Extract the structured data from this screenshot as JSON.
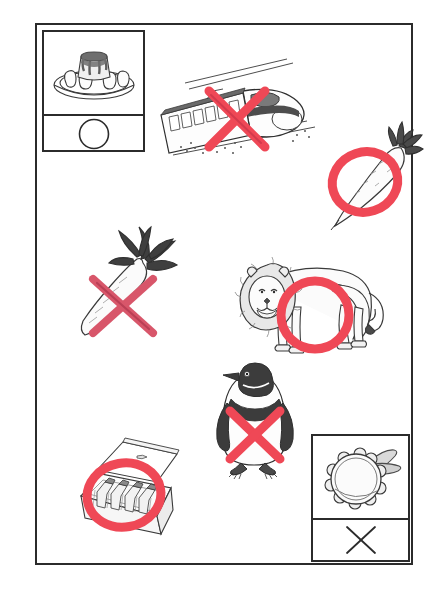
{
  "sheet": {
    "title": "Picture marking worksheet",
    "description": "Line drawings of objects and animals, each annotated with a hand-drawn red circle or red cross mark",
    "background_color": "#ffffff",
    "frame_color": "#2b2b2b",
    "mark_color": "#ef4856",
    "mark_color_dark": "#c9354a",
    "ink_color": "#3a3a3a"
  },
  "legend": {
    "top_left": {
      "picture_name": "pudding-on-plate",
      "picture_label": "Pudding on a plate",
      "mark_name": "circle-mark",
      "mark_symbol": "○",
      "mark_label": "Circle"
    },
    "bottom_right": {
      "picture_name": "tambourine",
      "picture_label": "Tambourine",
      "mark_name": "cross-mark",
      "mark_symbol": "×",
      "mark_label": "Cross"
    }
  },
  "items": [
    {
      "id": "train",
      "label": "Bullet train",
      "mark": "cross",
      "mark_label": "Cross"
    },
    {
      "id": "daikon-radish",
      "label": "Daikon radish",
      "mark": "circle",
      "mark_label": "Circle"
    },
    {
      "id": "carrot",
      "label": "Carrot",
      "mark": "cross",
      "mark_label": "Cross"
    },
    {
      "id": "lion",
      "label": "Lion",
      "mark": "circle",
      "mark_label": "Circle"
    },
    {
      "id": "penguin",
      "label": "Penguin",
      "mark": "cross",
      "mark_label": "Cross"
    },
    {
      "id": "bottle-case",
      "label": "Case of bottles",
      "mark": "circle",
      "mark_label": "Circle"
    }
  ]
}
